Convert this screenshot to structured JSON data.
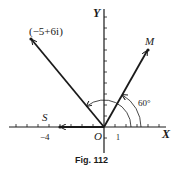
{
  "figure": {
    "caption": "Fig. 112",
    "axes": {
      "x_label": "X",
      "y_label": "Y",
      "origin_label": "O",
      "unit_tick_label": "1"
    },
    "points": [
      {
        "label": "(−5+6i)",
        "x": -5,
        "y": 6
      },
      {
        "label": "M",
        "angle_deg": 60
      },
      {
        "label": "S",
        "x": -4,
        "y": 0,
        "tick_label": "−4"
      }
    ],
    "angle_annotation": "60°",
    "colors": {
      "ink": "#1a1a1a",
      "background": "#ffffff"
    }
  }
}
